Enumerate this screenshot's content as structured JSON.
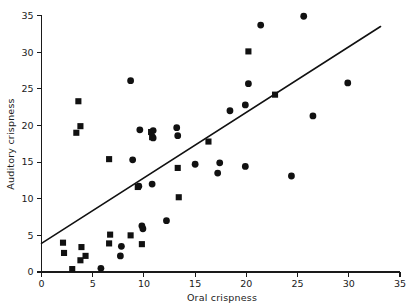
{
  "chart_data": {
    "type": "scatter",
    "title": "",
    "xlabel": "Oral crispness",
    "ylabel": "Auditory crispness",
    "xlim": [
      0,
      35
    ],
    "ylim": [
      0,
      35
    ],
    "xticks": [
      0,
      5,
      10,
      15,
      20,
      25,
      30,
      35
    ],
    "yticks": [
      0,
      5,
      10,
      15,
      20,
      25,
      30,
      35
    ],
    "xtick_labels": [
      "0",
      "5",
      "10",
      "15",
      "20",
      "25",
      "30",
      "35"
    ],
    "ytick_labels": [
      "0",
      "5",
      "10",
      "15",
      "20",
      "25",
      "30",
      "35"
    ],
    "grid": false,
    "legend": "none",
    "marker_color": "#111111",
    "line_color": "#111111",
    "trend_line": {
      "type": "linear-fit",
      "x_start": 0,
      "y_start": 3.9,
      "x_end": 33.1,
      "y_end": 33.5
    },
    "series": [
      {
        "name": "circle-markers",
        "marker": "circle",
        "points": [
          [
            5.8,
            0.5
          ],
          [
            7.7,
            2.2
          ],
          [
            7.8,
            3.5
          ],
          [
            9.8,
            6.3
          ],
          [
            9.9,
            5.9
          ],
          [
            12.2,
            7.0
          ],
          [
            9.5,
            11.7
          ],
          [
            10.8,
            12.0
          ],
          [
            17.2,
            13.5
          ],
          [
            24.4,
            13.1
          ],
          [
            15.0,
            14.7
          ],
          [
            17.4,
            14.9
          ],
          [
            19.9,
            14.4
          ],
          [
            8.9,
            15.3
          ],
          [
            13.3,
            18.6
          ],
          [
            10.9,
            18.3
          ],
          [
            9.6,
            19.4
          ],
          [
            10.9,
            19.3
          ],
          [
            13.2,
            19.7
          ],
          [
            26.5,
            21.3
          ],
          [
            18.4,
            22.0
          ],
          [
            19.9,
            22.8
          ],
          [
            8.7,
            26.1
          ],
          [
            20.2,
            25.7
          ],
          [
            29.9,
            25.8
          ],
          [
            21.4,
            33.7
          ],
          [
            25.6,
            34.9
          ]
        ]
      },
      {
        "name": "square-markers",
        "marker": "square",
        "points": [
          [
            3.0,
            0.4
          ],
          [
            3.8,
            1.6
          ],
          [
            4.3,
            2.2
          ],
          [
            2.2,
            2.6
          ],
          [
            3.9,
            3.4
          ],
          [
            2.1,
            4.0
          ],
          [
            6.6,
            3.9
          ],
          [
            9.8,
            3.8
          ],
          [
            6.7,
            5.1
          ],
          [
            8.7,
            5.0
          ],
          [
            13.4,
            10.2
          ],
          [
            9.4,
            11.6
          ],
          [
            13.3,
            14.2
          ],
          [
            6.6,
            15.4
          ],
          [
            16.3,
            17.8
          ],
          [
            10.8,
            18.4
          ],
          [
            10.7,
            19.1
          ],
          [
            3.4,
            19.0
          ],
          [
            3.8,
            19.9
          ],
          [
            3.6,
            23.3
          ],
          [
            22.8,
            24.2
          ],
          [
            20.2,
            30.1
          ]
        ]
      }
    ]
  }
}
